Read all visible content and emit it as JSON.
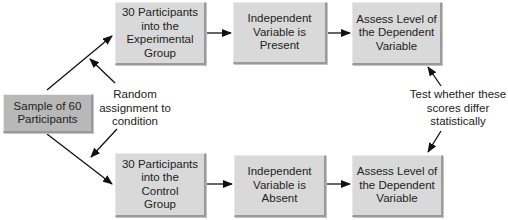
{
  "nodes": {
    "sample": "Sample of 60\nParticipants",
    "experimental_group": "30 Participants\ninto the\nExperimental\nGroup",
    "iv_present": "Independent\nVariable is\nPresent",
    "assess_top": "Assess Level of\nthe Dependent\nVariable",
    "control_group": "30 Participants\ninto the\nControl\nGroup",
    "iv_absent": "Independent\nVariable is\nAbsent",
    "assess_bottom": "Assess Level of\nthe Dependent\nVariable"
  },
  "annotations": {
    "random_assignment": "Random\nassignment to\ncondition",
    "test_difference": "Test whether these\nscores differ\nstatistically"
  },
  "colors": {
    "box_fill": "#d9d9d9",
    "sample_fill": "#b8b8b8",
    "arrow": "#111111"
  }
}
